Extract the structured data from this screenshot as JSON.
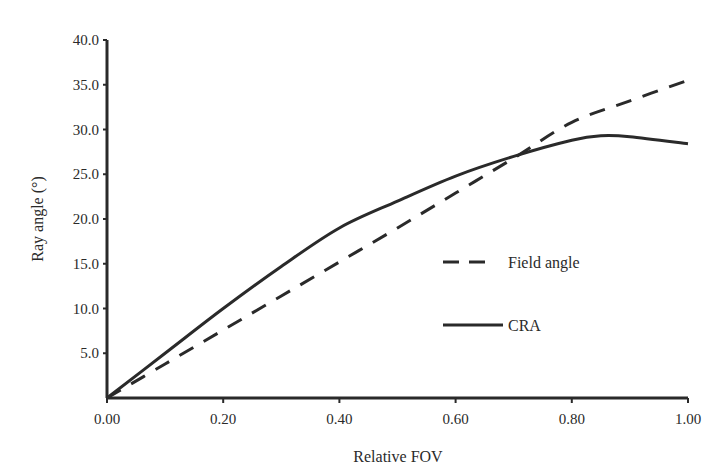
{
  "chart_data": {
    "type": "line",
    "title": "",
    "xlabel": "Relative FOV",
    "ylabel": "Ray angle (°)",
    "xlim": [
      0,
      1.0
    ],
    "ylim": [
      0,
      40
    ],
    "x_ticks": [
      "0.00",
      "0.20",
      "0.40",
      "0.60",
      "0.80",
      "1.00"
    ],
    "y_ticks": [
      "5.0",
      "10.0",
      "15.0",
      "20.0",
      "25.0",
      "30.0",
      "35.0",
      "40.0"
    ],
    "grid": false,
    "legend_position": "center-right",
    "series": [
      {
        "name": "Field angle",
        "style": "dashed",
        "x": [
          0.0,
          0.1,
          0.2,
          0.3,
          0.4,
          0.5,
          0.6,
          0.7,
          0.8,
          0.9,
          1.0
        ],
        "y": [
          0.0,
          3.8,
          7.6,
          11.4,
          15.2,
          19.0,
          22.9,
          26.8,
          30.8,
          33.2,
          35.5
        ]
      },
      {
        "name": "CRA",
        "style": "solid",
        "x": [
          0.0,
          0.1,
          0.2,
          0.3,
          0.4,
          0.5,
          0.6,
          0.7,
          0.8,
          0.85,
          0.9,
          1.0
        ],
        "y": [
          0.0,
          5.0,
          10.0,
          14.7,
          19.0,
          22.0,
          24.8,
          27.0,
          28.8,
          29.3,
          29.2,
          28.4
        ]
      }
    ],
    "colors": {
      "line": "#2a2a2a",
      "axis": "#2a2a2a"
    }
  }
}
